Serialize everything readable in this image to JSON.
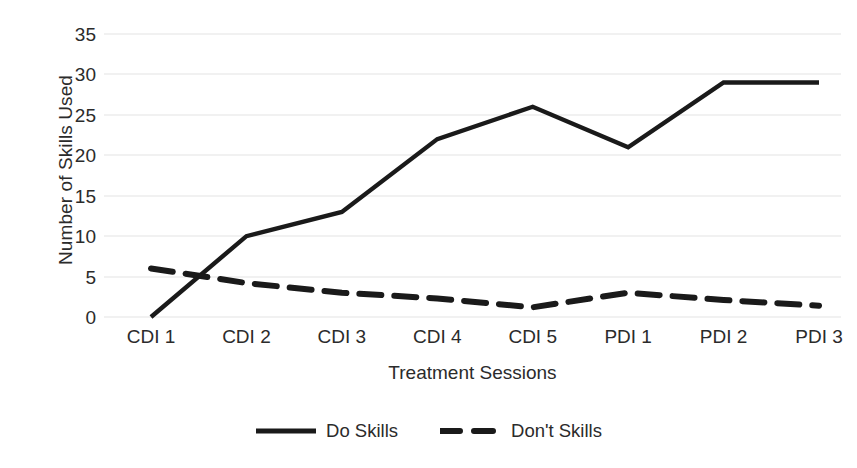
{
  "chart_data": {
    "type": "line",
    "title": "",
    "xlabel": "Treatment Sessions",
    "ylabel": "Number of Skills Used",
    "categories": [
      "CDI 1",
      "CDI 2",
      "CDI 3",
      "CDI 4",
      "CDI 5",
      "PDI 1",
      "PDI 2",
      "PDI 3"
    ],
    "series": [
      {
        "name": "Do Skills",
        "style": "solid",
        "color": "#1a1a1a",
        "values": [
          0,
          10,
          13,
          22,
          26,
          21,
          29,
          29
        ]
      },
      {
        "name": "Don't Skills",
        "style": "dashed",
        "color": "#1a1a1a",
        "values": [
          6,
          4.2,
          3,
          2.3,
          1.2,
          3,
          2.1,
          1.4
        ]
      }
    ],
    "ylim": [
      0,
      35
    ],
    "yticks": [
      0,
      5,
      10,
      15,
      20,
      25,
      30,
      35
    ],
    "ytick_labels": [
      "0",
      "5",
      "10",
      "15",
      "20",
      "25",
      "30",
      "35"
    ],
    "grid": true,
    "grid_color": "#e3e3e3",
    "legend_position": "bottom",
    "background": "#ffffff"
  },
  "legend": {
    "items": [
      {
        "label": "Do Skills",
        "swatch": "solid-line-swatch"
      },
      {
        "label": "Don't Skills",
        "swatch": "dashed-line-swatch"
      }
    ]
  },
  "axis_titles": {
    "y": "Number of Skills Used",
    "x": "Treatment Sessions"
  }
}
